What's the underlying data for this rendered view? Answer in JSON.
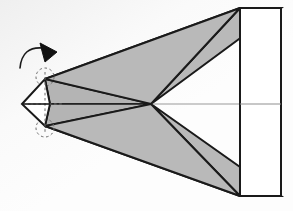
{
  "figure": {
    "canvas": {
      "width": 293,
      "height": 211
    },
    "colors": {
      "background": "#fbfbfb",
      "background_corner_tint": "#f0f0f0",
      "shade_gray": "#b9b9b9",
      "sliver_gray": "#b0b0b0",
      "outline": "#1a1a1a",
      "thin_line": "#8a8a8a",
      "solid_white": "#ffffff",
      "dashed_guide": "#6e6e6e",
      "arrow_fill": "#111111"
    },
    "stroke_widths": {
      "outline": 2.0,
      "thin": 1.0,
      "dashed": 1.0
    },
    "geometry": {
      "apex": {
        "label": "convergence-point",
        "x": 151,
        "y": 104
      },
      "diamond": {
        "label": "octahedron-silhouette",
        "left": {
          "x": 22,
          "y": 104
        },
        "top": {
          "x": 45,
          "y": 79
        },
        "right": {
          "x": 50,
          "y": 104
        },
        "bottom": {
          "x": 45,
          "y": 126
        },
        "fill": "#ffffff"
      },
      "screen_rect": {
        "label": "projection-screen",
        "x": 240,
        "y": 8,
        "width": 41,
        "height": 188,
        "midline_y": 104,
        "fill": "#ffffff"
      },
      "upper_shade_triangle": {
        "label": "upper-shadow-cone",
        "points": "151,104 240,8 281,8"
      },
      "lower_shade_triangle": {
        "label": "lower-shadow-cone",
        "points": "151,104 240,196 281,196"
      },
      "upper_sliver": {
        "label": "upper-ray-sliver",
        "points": "45,79 151,104 50,104"
      },
      "lower_sliver": {
        "label": "lower-ray-sliver",
        "points": "45,126 151,104 50,104"
      },
      "axis_line": {
        "label": "optical-axis",
        "x1": 151,
        "y1": 104,
        "x2": 281,
        "y2": 104
      },
      "rotation_arrow": {
        "label": "clockwise-rotation-arrow",
        "arc_path": "M 20,68 Q 24,46 44,48",
        "head_points": "43,44 56,53 45,61 44,52"
      },
      "dashed_circle_top": {
        "cx": 45,
        "cy": 77,
        "r": 9
      },
      "dashed_circle_bottom": {
        "cx": 45,
        "cy": 128,
        "r": 9
      },
      "dashed_axis_vertical": {
        "x": 45,
        "y1": 72,
        "y2": 133
      },
      "dashed_axis_horizontal": {
        "y": 104,
        "x1": 28,
        "x2": 62
      }
    }
  }
}
